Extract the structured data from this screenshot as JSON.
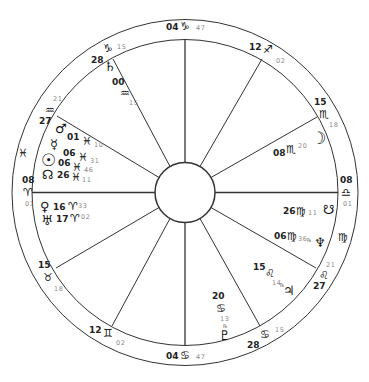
{
  "chart": {
    "center": [
      185,
      192
    ],
    "outer_radius": 173,
    "ring_inner_radius": 153,
    "hub_radius": 30,
    "line_color": "#333333",
    "text_color": "#1a1a1a",
    "minutes_color": "#888888"
  },
  "house_cusps": [
    {
      "name": "asc",
      "deg": "08",
      "sign": "♈",
      "min": "01",
      "sign_name": "aries"
    },
    {
      "name": "h2",
      "deg": "15",
      "sign": "♉",
      "min": "18",
      "sign_name": "taurus"
    },
    {
      "name": "h3",
      "deg": "12",
      "sign": "♊",
      "min": "02",
      "sign_name": "gemini"
    },
    {
      "name": "ic",
      "deg": "04",
      "sign": "♋",
      "min": "47",
      "sign_name": "cancer"
    },
    {
      "name": "h5",
      "deg": "28",
      "sign": "♋",
      "min": "15",
      "sign_name": "cancer"
    },
    {
      "name": "h6",
      "deg": "27",
      "sign": "♌",
      "min": "21",
      "sign_name": "leo"
    },
    {
      "name": "dsc",
      "deg": "08",
      "sign": "♎",
      "min": "01",
      "sign_name": "libra"
    },
    {
      "name": "h8",
      "deg": "15",
      "sign": "♏",
      "min": "18",
      "sign_name": "scorpio"
    },
    {
      "name": "h9",
      "deg": "12",
      "sign": "♐",
      "min": "02",
      "sign_name": "sagittarius"
    },
    {
      "name": "mc",
      "deg": "04",
      "sign": "♑",
      "min": "47",
      "sign_name": "capricorn"
    },
    {
      "name": "h11",
      "deg": "28",
      "sign": "♑",
      "min": "15",
      "sign_name": "capricorn"
    },
    {
      "name": "h12",
      "deg": "27",
      "sign": "♒",
      "min": "21",
      "sign_name": "aquarius"
    }
  ],
  "intercepted_signs": [
    {
      "sign": "♓",
      "sign_name": "pisces"
    },
    {
      "sign": "♍",
      "sign_name": "virgo"
    }
  ],
  "planets": [
    {
      "name": "saturn",
      "glyph": "♄",
      "deg": "00",
      "sign": "♒",
      "min": "15",
      "retro": ""
    },
    {
      "name": "mars",
      "glyph": "♂",
      "deg": "01",
      "sign": "♓",
      "min": "10",
      "retro": ""
    },
    {
      "name": "mercury",
      "glyph": "☿",
      "deg": "06",
      "sign": "♓",
      "min": "31",
      "retro": ""
    },
    {
      "name": "sun",
      "glyph": "☉",
      "deg": "06",
      "sign": "♓",
      "min": "46",
      "retro": ""
    },
    {
      "name": "north-node",
      "glyph": "☊",
      "deg": "26",
      "sign": "♓",
      "min": "11",
      "retro": ""
    },
    {
      "name": "venus",
      "glyph": "♀",
      "deg": "16",
      "sign": "♈",
      "min": "33",
      "retro": ""
    },
    {
      "name": "uranus",
      "glyph": "♅",
      "deg": "17",
      "sign": "♈",
      "min": "02",
      "retro": ""
    },
    {
      "name": "moon",
      "glyph": "☽",
      "deg": "08",
      "sign": "♏",
      "min": "20",
      "retro": ""
    },
    {
      "name": "south-node",
      "glyph": "☋",
      "deg": "26",
      "sign": "♍",
      "min": "11",
      "retro": ""
    },
    {
      "name": "neptune",
      "glyph": "♆",
      "deg": "06",
      "sign": "♍",
      "min": "36",
      "retro": "℞"
    },
    {
      "name": "jupiter",
      "glyph": "♃",
      "deg": "15",
      "sign": "♌",
      "min": "14",
      "retro": "℞"
    },
    {
      "name": "pluto",
      "glyph": "♇",
      "deg": "20",
      "sign": "♋",
      "min": "13",
      "retro": "℞"
    }
  ]
}
